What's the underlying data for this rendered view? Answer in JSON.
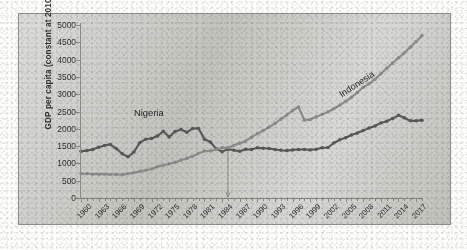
{
  "chart_data": {
    "type": "line",
    "title": "",
    "subtitle": "",
    "xlabel": "",
    "ylabel": "GDP per capita (constant at 2010)",
    "xlim": [
      1960,
      2018
    ],
    "ylim": [
      0,
      5000
    ],
    "ytick_interval": 500,
    "xtick_interval": 3,
    "grid": false,
    "legend_position": "inline-annotations",
    "y_ticks": [
      "0",
      "500",
      "1000",
      "1500",
      "2000",
      "2500",
      "3000",
      "3500",
      "4000",
      "4500",
      "5000"
    ],
    "x_ticks": [
      "1960",
      "1963",
      "1966",
      "1969",
      "1972",
      "1975",
      "1978",
      "1981",
      "1984",
      "1987",
      "1990",
      "1993",
      "1996",
      "1999",
      "2002",
      "2005",
      "2008",
      "2011",
      "2014",
      "2017"
    ],
    "annotations": [
      {
        "name": "nigeria-label",
        "text": "Nigeria",
        "x": 1969,
        "y": 2450,
        "rotation": 0
      },
      {
        "name": "indonesia-label",
        "text": "Indonesia",
        "x": 2004,
        "y": 2950,
        "rotation": -33
      },
      {
        "name": "crossover-marker",
        "text": "",
        "x": 1985,
        "y": 0,
        "rotation": 0
      }
    ],
    "series": [
      {
        "name": "Nigeria",
        "color": "#59595a",
        "marker": "circle",
        "x": [
          1960,
          1961,
          1962,
          1963,
          1964,
          1965,
          1966,
          1967,
          1968,
          1969,
          1970,
          1971,
          1972,
          1973,
          1974,
          1975,
          1976,
          1977,
          1978,
          1979,
          1980,
          1981,
          1982,
          1983,
          1984,
          1985,
          1986,
          1987,
          1988,
          1989,
          1990,
          1991,
          1992,
          1993,
          1994,
          1995,
          1996,
          1997,
          1998,
          1999,
          2000,
          2001,
          2002,
          2003,
          2004,
          2005,
          2006,
          2007,
          2008,
          2009,
          2010,
          2011,
          2012,
          2013,
          2014,
          2015,
          2016,
          2017,
          2018
        ],
        "values": [
          1350,
          1370,
          1400,
          1470,
          1520,
          1545,
          1430,
          1280,
          1190,
          1330,
          1600,
          1700,
          1720,
          1790,
          1930,
          1760,
          1920,
          1980,
          1900,
          2010,
          2010,
          1700,
          1620,
          1420,
          1340,
          1410,
          1380,
          1350,
          1410,
          1400,
          1450,
          1440,
          1430,
          1400,
          1380,
          1370,
          1390,
          1400,
          1400,
          1390,
          1410,
          1450,
          1460,
          1590,
          1680,
          1740,
          1820,
          1880,
          1950,
          2020,
          2080,
          2170,
          2220,
          2300,
          2390,
          2320,
          2230,
          2230,
          2250
        ]
      },
      {
        "name": "Indonesia",
        "color": "#8d8d8c",
        "marker": "circle",
        "x": [
          1960,
          1961,
          1962,
          1963,
          1964,
          1965,
          1966,
          1967,
          1968,
          1969,
          1970,
          1971,
          1972,
          1973,
          1974,
          1975,
          1976,
          1977,
          1978,
          1979,
          1980,
          1981,
          1982,
          1983,
          1984,
          1985,
          1986,
          1987,
          1988,
          1989,
          1990,
          1991,
          1992,
          1993,
          1994,
          1995,
          1996,
          1997,
          1998,
          1999,
          2000,
          2001,
          2002,
          2003,
          2004,
          2005,
          2006,
          2007,
          2008,
          2009,
          2010,
          2011,
          2012,
          2013,
          2014,
          2015,
          2016,
          2017,
          2018
        ],
        "values": [
          700,
          700,
          690,
          690,
          690,
          680,
          680,
          670,
          700,
          730,
          770,
          800,
          840,
          900,
          950,
          980,
          1030,
          1090,
          1150,
          1210,
          1290,
          1360,
          1360,
          1400,
          1450,
          1460,
          1520,
          1580,
          1650,
          1750,
          1860,
          1950,
          2050,
          2160,
          2280,
          2400,
          2530,
          2630,
          2250,
          2270,
          2350,
          2410,
          2490,
          2580,
          2680,
          2790,
          2910,
          3050,
          3200,
          3300,
          3430,
          3590,
          3750,
          3900,
          4050,
          4200,
          4360,
          4520,
          4700
        ]
      }
    ]
  },
  "axis": {
    "y_title": "GDP per capita (constant at 2010)"
  }
}
